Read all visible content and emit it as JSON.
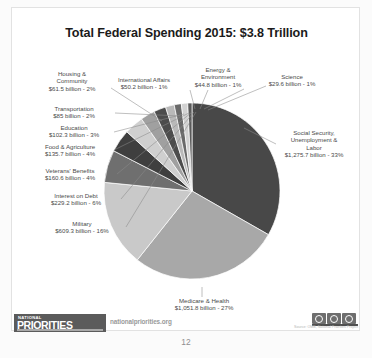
{
  "document": {
    "page_number": "12"
  },
  "chart_data": {
    "type": "pie",
    "title": "Total Federal Spending 2015: $3.8 Trillion",
    "total": "$3.8 Trillion",
    "year": "2015",
    "units": "billions of dollars",
    "legend": "labels",
    "grid": false,
    "categories": [
      "Social Security, Unemployment & Labor",
      "Medicare & Health",
      "Military",
      "Interest on Debt",
      "Veterans' Benefits",
      "Food & Agriculture",
      "Education",
      "Transportation",
      "Housing & Community",
      "International Affairs",
      "Energy & Environment",
      "Science"
    ],
    "values": [
      1275.7,
      1051.8,
      609.3,
      229.2,
      160.6,
      135.7,
      102.3,
      85.0,
      61.5,
      50.2,
      44.8,
      29.6
    ],
    "percents": [
      33,
      27,
      16,
      6,
      4,
      4,
      3,
      2,
      2,
      1,
      1,
      1
    ],
    "colors": [
      "#484848",
      "#a8a8a8",
      "#c9c9c9",
      "#6f6f6f",
      "#3f3f3f",
      "#cfcfcf",
      "#a0a0a0",
      "#4c4c4c",
      "#b9b9b9",
      "#6a6a6a",
      "#d2d2d2",
      "#5a5a5a"
    ],
    "slices": [
      {
        "name": "social-security",
        "label_line1": "Social Security,",
        "label_line2": "Unemployment &",
        "label_line3": "Labor",
        "label_line4": "$1,275.7 billion - 33%",
        "value": 1275.7,
        "percent": 33,
        "color": "#484848"
      },
      {
        "name": "medicare-health",
        "label_line1": "Medicare & Health",
        "label_line2": "$1,051.8 billion - 27%",
        "value": 1051.8,
        "percent": 27,
        "color": "#a8a8a8"
      },
      {
        "name": "military",
        "label_line1": "Military",
        "label_line2": "$609.3 billion - 16%",
        "value": 609.3,
        "percent": 16,
        "color": "#c9c9c9"
      },
      {
        "name": "interest-on-debt",
        "label_line1": "Interest on Debt",
        "label_line2": "$229.2 billion - 6%",
        "value": 229.2,
        "percent": 6,
        "color": "#6f6f6f"
      },
      {
        "name": "veterans-benefits",
        "label_line1": "Veterans' Benefits",
        "label_line2": "$160.6 billion - 4%",
        "value": 160.6,
        "percent": 4,
        "color": "#3f3f3f"
      },
      {
        "name": "food-agriculture",
        "label_line1": "Food & Agriculture",
        "label_line2": "$135.7 billion - 4%",
        "value": 135.7,
        "percent": 4,
        "color": "#cfcfcf"
      },
      {
        "name": "education",
        "label_line1": "Education",
        "label_line2": "$102.3 billion - 3%",
        "value": 102.3,
        "percent": 3,
        "color": "#a0a0a0"
      },
      {
        "name": "transportation",
        "label_line1": "Transportation",
        "label_line2": "$85 billion - 2%",
        "value": 85.0,
        "percent": 2,
        "color": "#4c4c4c"
      },
      {
        "name": "housing-community",
        "label_line1": "Housing &",
        "label_line2": "Community",
        "label_line3": "$61.5 billion - 2%",
        "value": 61.5,
        "percent": 2,
        "color": "#b9b9b9"
      },
      {
        "name": "international-affairs",
        "label_line1": "International Affairs",
        "label_line2": "$50.2 billion - 1%",
        "value": 50.2,
        "percent": 1,
        "color": "#6a6a6a"
      },
      {
        "name": "energy-environment",
        "label_line1": "Energy &",
        "label_line2": "Environment",
        "label_line3": "$44.8 billion - 1%",
        "value": 44.8,
        "percent": 1,
        "color": "#d2d2d2"
      },
      {
        "name": "science",
        "label_line1": "Science",
        "label_line2": "$29.6 billion - 1%",
        "value": 29.6,
        "percent": 1,
        "color": "#5a5a5a"
      }
    ]
  },
  "footer": {
    "logo_top": "NATIONAL",
    "logo_main": "PRIORITIES",
    "website": "nationalpriorities.org",
    "source": "Source: OMB, National Priorities Project",
    "license": "CC BY"
  }
}
